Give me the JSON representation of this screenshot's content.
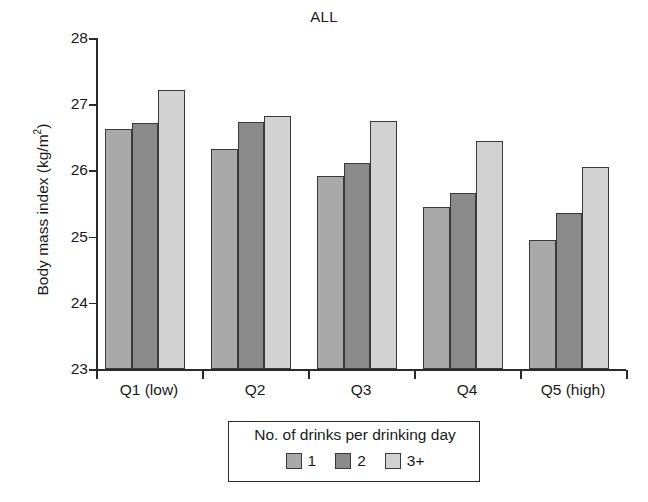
{
  "chart_data": {
    "type": "bar",
    "title": "ALL",
    "xlabel": "",
    "ylabel": "Body mass index (kg/m2)",
    "ylabel_parts": {
      "text": "Body mass index (kg/m",
      "sup": "2",
      "tail": ")"
    },
    "categories": [
      "Q1 (low)",
      "Q2",
      "Q3",
      "Q4",
      "Q5 (high)"
    ],
    "series": [
      {
        "name": "1",
        "color": "#a9a9a9",
        "values": [
          26.62,
          26.32,
          25.91,
          25.45,
          24.95
        ]
      },
      {
        "name": "2",
        "color": "#8a8a8a",
        "values": [
          26.72,
          26.73,
          26.11,
          25.66,
          25.35
        ]
      },
      {
        "name": "3+",
        "color": "#d2d2d2",
        "values": [
          27.22,
          26.82,
          26.75,
          26.44,
          26.05
        ]
      }
    ],
    "ylim": [
      23,
      28
    ],
    "yticks": [
      23,
      24,
      25,
      26,
      27,
      28
    ],
    "ytick_labels": [
      "23",
      "24",
      "25",
      "26",
      "27",
      "28"
    ],
    "grid": false,
    "legend_position": "bottom-center",
    "legend_title": "No. of drinks per drinking day"
  },
  "axis": {
    "line_color": "#2b2b2b"
  }
}
